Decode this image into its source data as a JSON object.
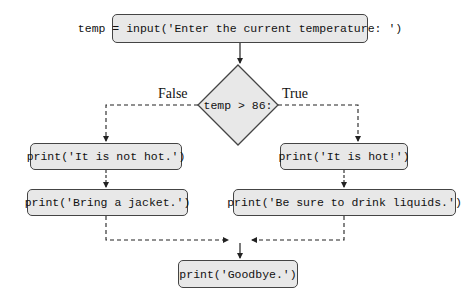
{
  "flowchart": {
    "start": "temp = input('Enter the current temperature: ')",
    "decision": "temp > 86:",
    "false_label": "False",
    "true_label": "True",
    "false_branch": [
      "print('It is not hot.')",
      "print('Bring a jacket.')"
    ],
    "true_branch": [
      "print('It is hot!')",
      "print('Be sure to drink liquids.')"
    ],
    "end": "print('Goodbye.')"
  },
  "colors": {
    "box_fill": "#e8e8e8",
    "stroke": "#444444"
  }
}
